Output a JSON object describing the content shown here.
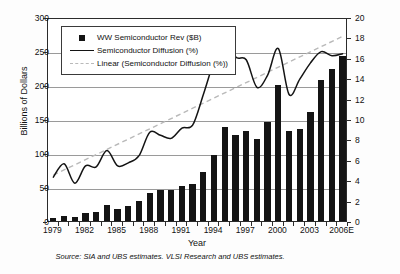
{
  "chart_data": {
    "type": "bar",
    "title": "",
    "xlabel": "Year",
    "ylabel": "Billions of Dollars",
    "y2label": "Semiconductor Diffusion Percentage (%)",
    "grid": true,
    "legend_position": "top-left",
    "ylim": [
      0,
      300
    ],
    "y2lim": [
      0,
      20
    ],
    "yticks": [
      0,
      50,
      100,
      150,
      200,
      250,
      300
    ],
    "y2ticks": [
      0,
      2,
      4,
      6,
      8,
      10,
      12,
      14,
      16,
      18,
      20
    ],
    "categories": [
      "1979",
      "1980",
      "1981",
      "1982",
      "1983",
      "1984",
      "1985",
      "1986",
      "1987",
      "1988",
      "1989",
      "1990",
      "1991",
      "1992",
      "1993",
      "1994",
      "1995",
      "1996",
      "1997",
      "1998",
      "1999",
      "2000",
      "2001",
      "2002",
      "2003",
      "2004",
      "2005",
      "2006E"
    ],
    "xtick_labels": [
      "1979",
      "1982",
      "1985",
      "1988",
      "1991",
      "1994",
      "1997",
      "2000",
      "2003",
      "2006E"
    ],
    "xtick_categories": [
      "1979",
      "1982",
      "1985",
      "1988",
      "1991",
      "1994",
      "1997",
      "2000",
      "2003",
      "2006E"
    ],
    "series": [
      {
        "name": "WW Semiconductor Rev ($B)",
        "type": "bar",
        "axis": "left",
        "unit": "$B",
        "color": "#141414",
        "values": [
          4,
          8,
          6,
          12,
          14,
          23,
          17,
          22,
          29,
          41,
          45,
          46,
          51,
          55,
          72,
          97,
          139,
          126,
          132,
          120,
          146,
          200,
          133,
          135,
          160,
          208,
          223,
          242
        ]
      },
      {
        "name": "Semiconductor Diffusion (%)",
        "type": "line",
        "axis": "right",
        "unit": "%",
        "color": "#141414",
        "values": [
          4.5,
          5.8,
          3.9,
          5.6,
          5.5,
          7.1,
          5.6,
          5.9,
          6.6,
          8.9,
          8.6,
          8.3,
          9.3,
          9.6,
          12.6,
          15.9,
          18.5,
          16.3,
          16.0,
          13.3,
          14.5,
          17.1,
          12.6,
          14.1,
          15.7,
          16.8,
          16.4,
          16.6
        ]
      },
      {
        "name": "Linear (Semiconductor Diffusion (%))",
        "type": "trendline",
        "axis": "right",
        "unit": "%",
        "color": "#b9b9b9",
        "style": "dashed",
        "values": [
          4.7,
          5.2,
          5.7,
          6.2,
          6.7,
          7.2,
          7.7,
          8.2,
          8.7,
          9.2,
          9.7,
          10.2,
          10.7,
          11.2,
          11.7,
          12.2,
          12.7,
          13.2,
          13.7,
          14.2,
          14.7,
          15.2,
          15.7,
          16.2,
          16.7,
          17.2,
          17.7,
          18.3
        ]
      }
    ],
    "source_note": "Source: SIA and UBS estimates. VLSI Research and UBS estimates."
  },
  "legend": {
    "items": [
      {
        "label": "WW Semiconductor Rev ($B)",
        "key": "square-marker"
      },
      {
        "label": "Semiconductor Diffusion (%)",
        "key": "solid-line"
      },
      {
        "label": "Linear (Semiconductor Diffusion (%))",
        "key": "dashed-line"
      }
    ]
  }
}
